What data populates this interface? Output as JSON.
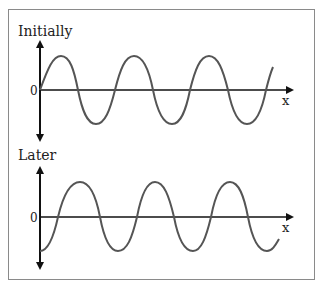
{
  "panels": [
    {
      "title": "Initially",
      "origin_label": "0",
      "axis_label": "x",
      "wave": {
        "phase": "starts at zero going up",
        "cycles_shown": 3.25
      }
    },
    {
      "title": "Later",
      "origin_label": "0",
      "axis_label": "x",
      "wave": {
        "phase": "starts at trough",
        "cycles_shown": 3.25
      }
    }
  ],
  "colors": {
    "wave": "#555555",
    "axis": "#111111",
    "frame": "#8a8a8a"
  }
}
